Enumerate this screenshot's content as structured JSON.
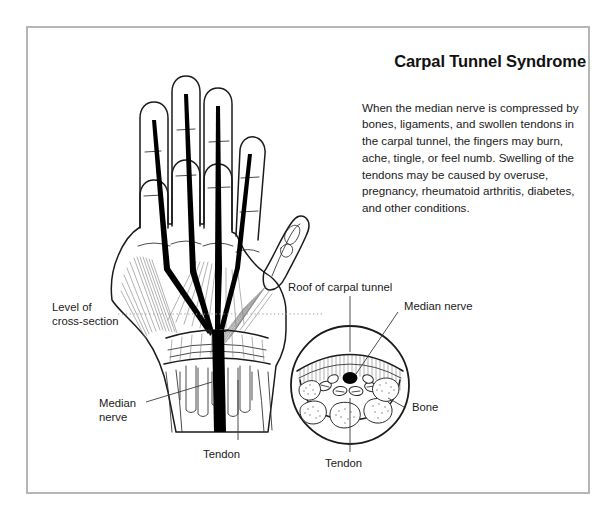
{
  "page": {
    "title": "Carpal Tunnel Syndrome",
    "body_text": "When the median nerve is compressed by bones, ligaments, and swollen tendons in the carpal tunnel, the fingers may burn, ache, tingle, or feel numb. Swelling of the tendons may be caused by overuse, pregnancy, rheumatoid arthritis, diabetes, and other conditions."
  },
  "colors": {
    "frame_border": "#b6b6b6",
    "background": "#ffffff",
    "ink": "#1b1b1b",
    "nerve": "#000000",
    "leader": "#3a3a3a",
    "dotted_leader": "#9a9a9a"
  },
  "labels": {
    "level_of_cross_section_line1": "Level of",
    "level_of_cross_section_line2": "cross-section",
    "median_nerve_hand_line1": "Median",
    "median_nerve_hand_line2": "nerve",
    "tendon_hand": "Tendon",
    "roof_of_carpal_tunnel": "Roof of carpal tunnel",
    "median_nerve_cross": "Median nerve",
    "bone_cross": "Bone",
    "tendon_cross": "Tendon"
  },
  "diagram": {
    "hand_view": "palmar view of right hand with flexor tendons and median nerve",
    "cross_section_view": "transverse section of the wrist at the carpal tunnel",
    "cross_section_contents": [
      "roof of carpal tunnel",
      "median nerve",
      "tendons",
      "bone"
    ]
  }
}
